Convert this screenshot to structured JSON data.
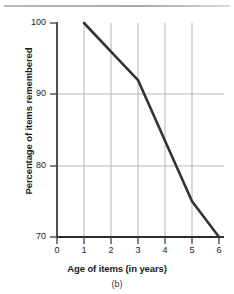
{
  "figure": {
    "caption": "(b)",
    "top_rule": true
  },
  "chart_data": {
    "type": "line",
    "title": "",
    "subtitle": "",
    "xlabel": "Age of items (in years)",
    "ylabel": "Percentage of items remembered",
    "x": [
      1,
      2,
      3,
      4,
      5,
      6
    ],
    "values": [
      100,
      96,
      92,
      83.5,
      75,
      70
    ],
    "series": [
      {
        "name": "Percentage of items remembered",
        "values": [
          100,
          96,
          92,
          83.5,
          75,
          70
        ]
      }
    ],
    "xlim": [
      0,
      6
    ],
    "ylim": [
      70,
      100
    ],
    "xticks": [
      0,
      1,
      2,
      3,
      4,
      5,
      6
    ],
    "yticks": [
      70,
      80,
      90,
      100
    ],
    "xtick_labels": [
      "0",
      "1",
      "2",
      "3",
      "4",
      "5",
      "6"
    ],
    "ytick_labels": [
      "70",
      "80",
      "90",
      "100"
    ],
    "grid": true,
    "grid_x_at": [
      1,
      2,
      3,
      4,
      5
    ],
    "grid_y_at": [
      80,
      90
    ],
    "legend": null,
    "legend_position": "none",
    "annotations": [],
    "line_color": "#333333",
    "grid_color": "#b5b5b5",
    "axis_color": "#4d4d4d"
  }
}
